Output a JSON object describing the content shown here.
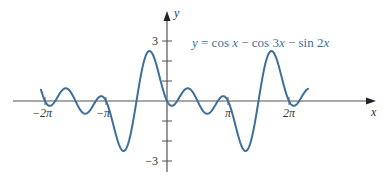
{
  "chart_data": {
    "type": "line",
    "title": "",
    "function": "y = cos x - cos 3x - sin 2x",
    "annotation": {
      "parts": [
        {
          "t": "y",
          "italic": true
        },
        {
          "t": " = cos ",
          "italic": false
        },
        {
          "t": "x",
          "italic": true
        },
        {
          "t": " − cos 3",
          "italic": false
        },
        {
          "t": "x",
          "italic": true
        },
        {
          "t": " − sin 2",
          "italic": false
        },
        {
          "t": "x",
          "italic": true
        }
      ]
    },
    "xlabel": "x",
    "ylabel": "y",
    "x_ticks": [
      {
        "value": -6.283185,
        "label": "−2π"
      },
      {
        "value": -3.141593,
        "label": "−π"
      },
      {
        "value": 3.141593,
        "label": "π"
      },
      {
        "value": 6.283185,
        "label": "2π"
      }
    ],
    "y_ticks": [
      {
        "value": 3,
        "label": "3"
      },
      {
        "value": 2,
        "label": ""
      },
      {
        "value": 1,
        "label": ""
      },
      {
        "value": -1,
        "label": ""
      },
      {
        "value": -2,
        "label": ""
      },
      {
        "value": -3,
        "label": "−3"
      }
    ],
    "xlim": [
      -6.49,
      7.26
    ],
    "ylim": [
      -3.3,
      4.4
    ],
    "grid": false,
    "legend": "none",
    "series": [
      {
        "name": "y = cos x − cos 3x − sin 2x",
        "color": "#3d6f9a",
        "sample_points": [
          {
            "x": -6.49,
            "y": 0.58
          },
          {
            "x": -6.283,
            "y": 0.0
          },
          {
            "x": -5.5,
            "y": 1.0
          },
          {
            "x": -3.14,
            "y": 0.0
          },
          {
            "x": -1.9,
            "y": -2.6
          },
          {
            "x": -0.72,
            "y": 2.6
          },
          {
            "x": 0.0,
            "y": 0.0
          },
          {
            "x": 0.72,
            "y": 0.6
          },
          {
            "x": 1.9,
            "y": -0.6
          },
          {
            "x": 3.14,
            "y": 0.0
          },
          {
            "x": 4.38,
            "y": -2.6
          },
          {
            "x": 5.56,
            "y": 2.6
          },
          {
            "x": 6.283,
            "y": 0.0
          },
          {
            "x": 7.26,
            "y": 0.7
          }
        ]
      }
    ]
  },
  "colors": {
    "curve": "#3d6f9a",
    "axis": "#555555",
    "text": "#333333"
  }
}
